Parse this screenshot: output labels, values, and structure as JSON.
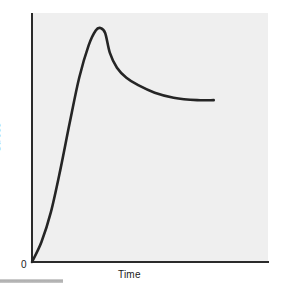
{
  "chart_data": {
    "type": "line",
    "title": "",
    "subtitle": "",
    "xlabel": "Time",
    "ylabel": "Stress",
    "origin_label": "0",
    "grid": false,
    "legend": null,
    "annotations": [],
    "xlim": [
      0,
      1
    ],
    "ylim": [
      0,
      1
    ],
    "axis_ticks": {
      "x": [],
      "y": []
    },
    "series": [
      {
        "name": "Stress vs Time",
        "color": "#252525",
        "description": "Rapid rise to an upper yield peak, sharp drop, then a long gradually declining plateau",
        "x": [
          0.0,
          0.04,
          0.08,
          0.12,
          0.16,
          0.2,
          0.24,
          0.27,
          0.29,
          0.31,
          0.33,
          0.36,
          0.4,
          0.45,
          0.52,
          0.6,
          0.7,
          0.77
        ],
        "y": [
          0.0,
          0.08,
          0.2,
          0.37,
          0.56,
          0.74,
          0.87,
          0.93,
          0.94,
          0.92,
          0.84,
          0.78,
          0.74,
          0.71,
          0.68,
          0.66,
          0.65,
          0.65
        ]
      }
    ],
    "colors": {
      "curve": "#252525",
      "axis": "#2b2b2b",
      "panel_background": "#efefef",
      "figure_background": "#ffffff",
      "rule": "#a9a9a9",
      "text": "#1a1a1a"
    }
  },
  "figure": {
    "ylabel": "Stress",
    "xlabel": "Time",
    "origin": "0"
  }
}
